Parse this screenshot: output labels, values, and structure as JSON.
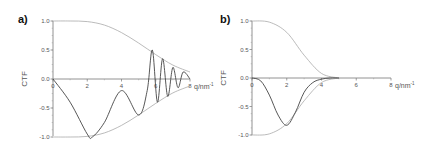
{
  "chart_data": [
    {
      "type": "line",
      "panel_label": "a)",
      "xlabel": "q/nm⁻¹",
      "ylabel": "CTF",
      "xlim": [
        0,
        8
      ],
      "ylim": [
        -1.0,
        1.0
      ],
      "x_ticks": [
        "0",
        "2",
        "4",
        "6",
        "8"
      ],
      "y_ticks": [
        "1.0",
        "0.5",
        "0.0",
        "-0.5",
        "-1.0"
      ],
      "grid": false,
      "series": [
        {
          "name": "envelope (+)",
          "color": "#aaaaaa",
          "x": [
            0,
            1,
            2,
            3,
            4,
            5,
            6,
            7,
            8
          ],
          "y": [
            1.0,
            1.0,
            0.99,
            0.93,
            0.8,
            0.62,
            0.42,
            0.24,
            0.12
          ]
        },
        {
          "name": "envelope (-)",
          "color": "#aaaaaa",
          "x": [
            0,
            1,
            2,
            3,
            4,
            5,
            6,
            7,
            8
          ],
          "y": [
            -1.0,
            -1.0,
            -0.99,
            -0.93,
            -0.8,
            -0.62,
            -0.42,
            -0.24,
            -0.12
          ]
        },
        {
          "name": "CTF",
          "color": "#444444",
          "x": [
            0,
            1,
            2,
            2.3,
            3,
            4,
            5,
            5.5,
            5.8,
            6.1,
            6.4,
            6.7,
            7,
            7.3,
            7.6,
            8
          ],
          "y": [
            0,
            -0.4,
            -0.95,
            -1.0,
            -0.75,
            -0.2,
            -0.62,
            -0.2,
            0.5,
            -0.4,
            0.35,
            -0.3,
            0.2,
            -0.15,
            0.12,
            0
          ]
        }
      ]
    },
    {
      "type": "line",
      "panel_label": "b)",
      "xlabel": "q/nm⁻¹",
      "ylabel": "CTF",
      "xlim": [
        0,
        8
      ],
      "ylim": [
        -1.0,
        1.0
      ],
      "x_ticks": [
        "0",
        "2",
        "4",
        "6",
        "8"
      ],
      "y_ticks": [
        "1.0",
        "0.5",
        "0.0",
        "-0.5",
        "-1.0"
      ],
      "grid": false,
      "series": [
        {
          "name": "envelope (+)",
          "color": "#aaaaaa",
          "x": [
            0,
            1,
            2,
            3,
            4,
            5
          ],
          "y": [
            1.0,
            0.98,
            0.8,
            0.4,
            0.08,
            0
          ]
        },
        {
          "name": "envelope (-)",
          "color": "#aaaaaa",
          "x": [
            0,
            1,
            2,
            3,
            4,
            5
          ],
          "y": [
            -1.0,
            -0.98,
            -0.8,
            -0.4,
            -0.08,
            0
          ]
        },
        {
          "name": "CTF",
          "color": "#444444",
          "x": [
            0,
            0.5,
            1,
            1.5,
            2,
            2.5,
            3,
            3.5,
            4,
            4.5,
            5
          ],
          "y": [
            0,
            -0.05,
            -0.3,
            -0.65,
            -0.83,
            -0.6,
            -0.25,
            -0.08,
            -0.02,
            0,
            0
          ]
        }
      ]
    }
  ],
  "panels": [
    {
      "label": "a)",
      "ylabel": "CTF",
      "xlabel_main": "q/nm",
      "xlabel_sup": "-1"
    },
    {
      "label": "b)",
      "ylabel": "CTF",
      "xlabel_main": "q/nm",
      "xlabel_sup": "-1"
    }
  ]
}
